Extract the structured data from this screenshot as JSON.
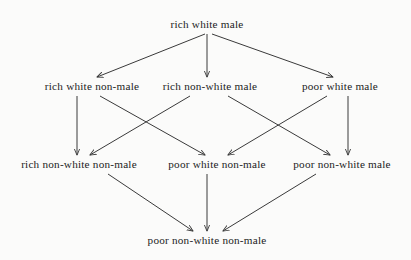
{
  "figure": {
    "type": "hasse-diagram",
    "background_color": "#fbfbfa",
    "ink_color": "#3a3a3a",
    "text_color": "#1c1c1c"
  },
  "nodes": [
    {
      "id": "rwm",
      "label": "rich white male",
      "x": 207,
      "y": 25,
      "level": 0
    },
    {
      "id": "rwn",
      "label": "rich white non-male",
      "x": 92,
      "y": 87,
      "level": 1
    },
    {
      "id": "rnwm",
      "label": "rich non-white male",
      "x": 210,
      "y": 87,
      "level": 1
    },
    {
      "id": "pwm",
      "label": "poor white male",
      "x": 340,
      "y": 87,
      "level": 1
    },
    {
      "id": "rnwn",
      "label": "rich non-white non-male",
      "x": 79,
      "y": 165,
      "level": 2
    },
    {
      "id": "pwn",
      "label": "poor white non-male",
      "x": 217,
      "y": 165,
      "level": 2
    },
    {
      "id": "pnwm",
      "label": "poor non-white male",
      "x": 342,
      "y": 165,
      "level": 2
    },
    {
      "id": "pnwn",
      "label": "poor non-white non-male",
      "x": 207,
      "y": 241,
      "level": 3
    }
  ],
  "edges": [
    {
      "from": "rwm",
      "to": "rwn",
      "x1": 205,
      "y1": 34,
      "x2": 97,
      "y2": 77
    },
    {
      "from": "rwm",
      "to": "rnwm",
      "x1": 207,
      "y1": 34,
      "x2": 207,
      "y2": 77
    },
    {
      "from": "rwm",
      "to": "pwm",
      "x1": 212,
      "y1": 34,
      "x2": 333,
      "y2": 77
    },
    {
      "from": "rwn",
      "to": "rnwn",
      "x1": 77,
      "y1": 96,
      "x2": 77,
      "y2": 155
    },
    {
      "from": "rwn",
      "to": "pwn",
      "x1": 100,
      "y1": 96,
      "x2": 205,
      "y2": 155
    },
    {
      "from": "rnwm",
      "to": "rnwn",
      "x1": 190,
      "y1": 96,
      "x2": 90,
      "y2": 155
    },
    {
      "from": "rnwm",
      "to": "pnwm",
      "x1": 228,
      "y1": 96,
      "x2": 330,
      "y2": 155
    },
    {
      "from": "pwm",
      "to": "pwn",
      "x1": 327,
      "y1": 96,
      "x2": 228,
      "y2": 155
    },
    {
      "from": "pwm",
      "to": "pnwm",
      "x1": 348,
      "y1": 96,
      "x2": 348,
      "y2": 155
    },
    {
      "from": "rnwn",
      "to": "pnwn",
      "x1": 108,
      "y1": 174,
      "x2": 193,
      "y2": 231
    },
    {
      "from": "pwn",
      "to": "pnwn",
      "x1": 207,
      "y1": 174,
      "x2": 207,
      "y2": 231
    },
    {
      "from": "pnwm",
      "to": "pnwn",
      "x1": 316,
      "y1": 174,
      "x2": 223,
      "y2": 231
    }
  ]
}
